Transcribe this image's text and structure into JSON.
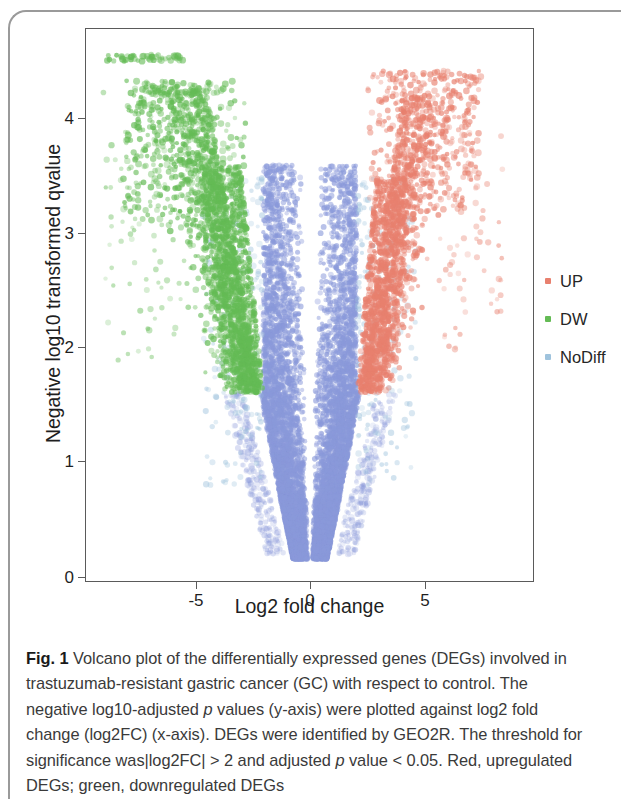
{
  "figure": {
    "axes": {
      "x_label": "Log2 fold change",
      "y_label": "Negative log10 transformed qvalue",
      "x_ticks": [
        "-5",
        "0",
        "5"
      ],
      "y_ticks": [
        "0",
        "1",
        "2",
        "3",
        "4"
      ]
    },
    "legend": {
      "title": "",
      "items": [
        {
          "label": "UP",
          "color": "#e8806e"
        },
        {
          "label": "DW",
          "color": "#64bb55"
        },
        {
          "label": "NoDiff",
          "color": "#9fc3dd"
        }
      ]
    }
  },
  "caption": {
    "figure_number": "Fig. 1",
    "line1": " Volcano plot of the differentially expressed genes (DEGs)",
    "line2": "involved in trastuzumab-resistant gastric cancer (GC) with respect to",
    "line3a": "control. The negative log10-adjusted ",
    "line3b": "p",
    "line3c": " values (y-axis) were plotted",
    "line4": "against log2 fold change (log2FC) (x-axis). DEGs were identified by",
    "line5": "GEO2R. The threshold for significance was|log2FC| > 2 and adjusted",
    "line6a": "p",
    "line6b": " value < 0.05. Red, upregulated DEGs; green, downregulated DEGs"
  },
  "chart_data": {
    "type": "scatter",
    "title": "",
    "xlabel": "Log2 fold change",
    "ylabel": "Negative log10 transformed qvalue",
    "xlim": [
      -9.6,
      9.8
    ],
    "ylim": [
      -0.05,
      4.85
    ],
    "xticks": [
      -5,
      0,
      5
    ],
    "yticks": [
      0,
      1,
      2,
      3,
      4
    ],
    "grid": false,
    "legend_position": "right",
    "significance_thresholds": {
      "abs_log2fc": 2,
      "adjusted_p": 0.05
    },
    "series": [
      {
        "name": "UP",
        "color": "#e8806e",
        "description": "Upregulated DEGs: log2FC > 2, right plume, q from ~1.8 up to ~4.4",
        "n_points": 900,
        "x_range": [
          2.0,
          8.6
        ],
        "y_range": [
          1.6,
          4.45
        ],
        "density_center": [
          3.0,
          2.7
        ]
      },
      {
        "name": "DW",
        "color": "#64bb55",
        "description": "Downregulated DEGs: log2FC < -2, left plume, q from ~1.7 up to ~4.6 with a capped row near 4.55",
        "n_points": 1100,
        "x_range": [
          -9.2,
          -2.0
        ],
        "y_range": [
          1.6,
          4.6
        ],
        "density_center": [
          -3.3,
          2.9
        ],
        "capped_row_y": 4.55,
        "capped_row_x_range": [
          -9.0,
          -5.5
        ]
      },
      {
        "name": "NoDiff",
        "color": "#9fc3dd",
        "description": "Non-significant genes: central blue-violet V-shaped cloud, dense from q 0.15 to ~3.5, split by an empty band at log2FC = 0",
        "n_points": 9000,
        "x_range": [
          -4.2,
          4.2
        ],
        "y_range": [
          0.15,
          3.6
        ],
        "fill_color": "#8a99da",
        "gap_at_zero": true
      }
    ]
  }
}
